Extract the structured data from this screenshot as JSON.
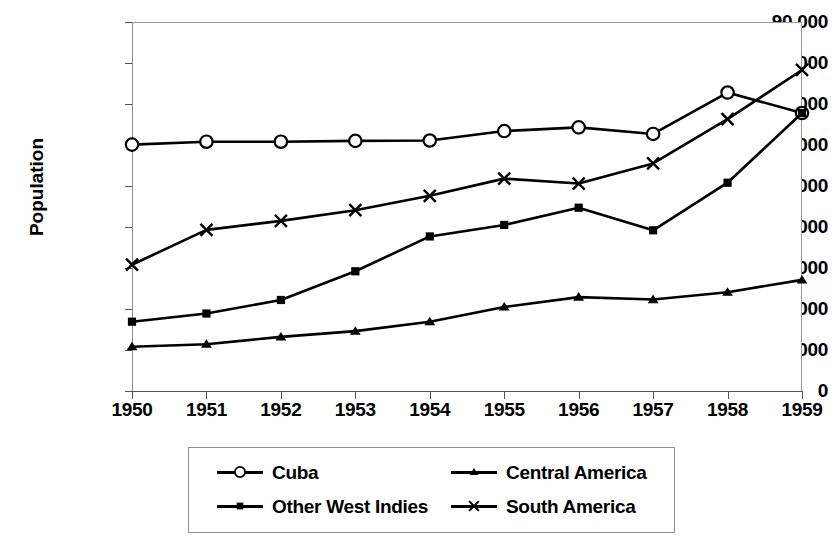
{
  "chart_data": {
    "type": "line",
    "title": "",
    "xlabel": "",
    "ylabel": "Population",
    "categories": [
      1950,
      1951,
      1952,
      1953,
      1954,
      1955,
      1956,
      1957,
      1958,
      1959
    ],
    "xtick_labels": [
      "1950",
      "1951",
      "1952",
      "1953",
      "1954",
      "1955",
      "1956",
      "1957",
      "1958",
      "1959"
    ],
    "ytick_labels": [
      "0",
      "10,000",
      "20,000",
      "30,000",
      "40,000",
      "50,000",
      "60,000",
      "70,000",
      "80,000",
      "90,000"
    ],
    "ytick_values": [
      0,
      10000,
      20000,
      30000,
      40000,
      50000,
      60000,
      70000,
      80000,
      90000
    ],
    "ylim": [
      0,
      90000
    ],
    "xlim": [
      1950,
      1959
    ],
    "grid": false,
    "legend_position": "bottom",
    "line_color": "#000000",
    "series": [
      {
        "name": "Cuba",
        "marker": "circle",
        "values": [
          60100,
          60800,
          60800,
          61000,
          61100,
          63400,
          64300,
          62700,
          72800,
          67800
        ]
      },
      {
        "name": "Other West Indies",
        "marker": "square",
        "values": [
          16900,
          18900,
          22200,
          29200,
          37700,
          40500,
          44700,
          39200,
          50800,
          67800
        ]
      },
      {
        "name": "Central America",
        "marker": "triangle",
        "values": [
          10800,
          11400,
          13200,
          14600,
          16900,
          20500,
          22900,
          22300,
          24100,
          27100
        ]
      },
      {
        "name": "South America",
        "marker": "cross",
        "values": [
          30800,
          39300,
          41500,
          44100,
          47600,
          51800,
          50600,
          55500,
          66300,
          78300
        ]
      }
    ]
  },
  "legend": {
    "entries": [
      {
        "label": "Cuba",
        "marker": "circle"
      },
      {
        "label": "Central America",
        "marker": "triangle"
      },
      {
        "label": "Other West Indies",
        "marker": "square"
      },
      {
        "label": "South America",
        "marker": "cross"
      }
    ]
  }
}
